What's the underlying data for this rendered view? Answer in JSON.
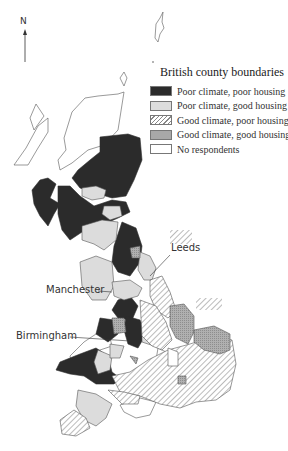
{
  "north_arrow": {
    "label": "N"
  },
  "legend": {
    "title": "British county boundaries",
    "items": [
      {
        "label": "Poor climate, poor housing",
        "pattern": "solid-dark",
        "color": "#2b2b2b"
      },
      {
        "label": "Poor climate, good housing",
        "pattern": "solid-light",
        "color": "#dcdcdc"
      },
      {
        "label": "Good climate, poor housing",
        "pattern": "diagonal-hatch",
        "color": "#ffffff"
      },
      {
        "label": "Good climate, good housing",
        "pattern": "cross-hatch-grey",
        "color": "#a8a8a8"
      },
      {
        "label": "No respondents",
        "pattern": "none",
        "color": "#ffffff"
      }
    ]
  },
  "cities": [
    {
      "name": "Leeds"
    },
    {
      "name": "Manchester"
    },
    {
      "name": "Birmingham"
    }
  ],
  "colors": {
    "dark": "#2b2b2b",
    "light": "#dcdcdc",
    "grey": "#a6a6a6",
    "outline": "#555555"
  }
}
